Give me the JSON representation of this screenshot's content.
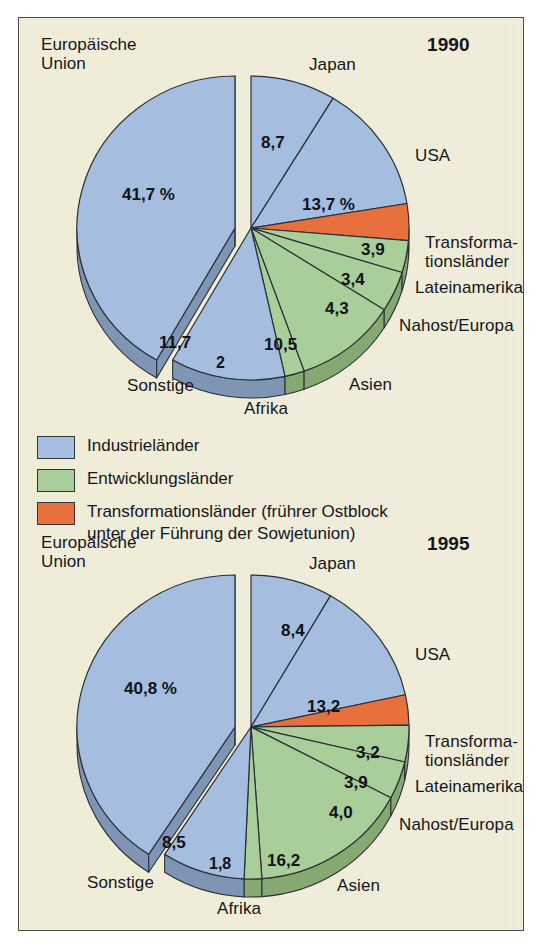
{
  "figure": {
    "background_color": "#eeecd7",
    "border_color": "#4a4a48"
  },
  "colors": {
    "industrial": "#a5bedf",
    "industrial_side": "#7f95b4",
    "developing": "#a9ce99",
    "developing_side": "#86a871",
    "transformation": "#e8703c",
    "transformation_side": "#bc5a2e",
    "outline": "#2b3038"
  },
  "legend": {
    "items": [
      {
        "label": "Industrieländer",
        "color": "#a5bedf",
        "name": "industrial"
      },
      {
        "label": "Entwicklungsländer",
        "color": "#a9ce99",
        "name": "developing"
      },
      {
        "label": "Transformationsländer (frührer Ostblock\nunter der Führung der Sowjetunion)",
        "color": "#e8703c",
        "name": "transformation"
      }
    ]
  },
  "chart_data": [
    {
      "type": "pie",
      "title": "1990",
      "unit": "%",
      "center": [
        240,
        223
      ],
      "radius": 162,
      "explode_slice": "Europäische Union",
      "categories": [
        "Japan",
        "USA",
        "Transformationsländer",
        "Lateinamerika",
        "Nahost/Europa",
        "Asien",
        "Afrika",
        "Sonstige",
        "Europäische Union"
      ],
      "values": [
        8.7,
        13.7,
        3.9,
        3.4,
        4.3,
        10.5,
        2,
        11.7,
        41.7
      ],
      "value_labels": [
        "8,7",
        "13,7 %",
        "3,9",
        "3,4",
        "4,3",
        "10,5",
        "2",
        "11,7",
        "41,7 %"
      ],
      "groups": [
        "Industrieländer",
        "Industrieländer",
        "Transformationsländer",
        "Entwicklungsländer",
        "Entwicklungsländer",
        "Entwicklungsländer",
        "Entwicklungsländer",
        "Industrieländer",
        "Industrieländer"
      ],
      "callout_labels": [
        "Japan",
        "USA",
        "Transforma-\ntionsländer",
        "Lateinamerika",
        "Nahost/Europa",
        "Asien",
        "Afrika",
        "Sonstige",
        "Europäische\nUnion"
      ]
    },
    {
      "type": "pie",
      "title": "1995",
      "unit": "%",
      "center": [
        240,
        268
      ],
      "radius": 162,
      "explode_slice": "Europäische Union",
      "categories": [
        "Japan",
        "USA",
        "Transformationsländer",
        "Lateinamerika",
        "Nahost/Europa",
        "Asien",
        "Afrika",
        "Sonstige",
        "Europäische Union"
      ],
      "values": [
        8.4,
        13.2,
        3.2,
        3.9,
        4.0,
        16.2,
        1.8,
        8.5,
        40.8
      ],
      "value_labels": [
        "8,4",
        "13,2",
        "3,2",
        "3,9",
        "4,0",
        "16,2",
        "1,8",
        "8,5",
        "40,8 %"
      ],
      "groups": [
        "Industrieländer",
        "Industrieländer",
        "Transformationsländer",
        "Entwicklungsländer",
        "Entwicklungsländer",
        "Entwicklungsländer",
        "Entwicklungsländer",
        "Industrieländer",
        "Industrieländer"
      ],
      "callout_labels": [
        "Japan",
        "USA",
        "Transforma-\ntionsländer",
        "Lateinamerika",
        "Nahost/Europa",
        "Asien",
        "Afrika",
        "Sonstige",
        "Europäische\nUnion"
      ]
    }
  ],
  "chart1": {
    "year": "1990",
    "labels": {
      "eu": "Europäische\nUnion",
      "japan": "Japan",
      "usa": "USA",
      "transformation": "Transforma-\ntionsländer",
      "lateinamerika": "Lateinamerika",
      "nahost": "Nahost/Europa",
      "asien": "Asien",
      "afrika": "Afrika",
      "sonstige": "Sonstige"
    },
    "values": {
      "eu": "41,7 %",
      "japan": "8,7",
      "usa": "13,7 %",
      "transformation": "3,9",
      "lateinamerika": "3,4",
      "nahost": "4,3",
      "asien": "10,5",
      "afrika": "2",
      "sonstige": "11,7"
    }
  },
  "chart2": {
    "year": "1995",
    "labels": {
      "eu": "Europäische\nUnion",
      "japan": "Japan",
      "usa": "USA",
      "transformation": "Transforma-\ntionsländer",
      "lateinamerika": "Lateinamerika",
      "nahost": "Nahost/Europa",
      "asien": "Asien",
      "afrika": "Afrika",
      "sonstige": "Sonstige"
    },
    "values": {
      "eu": "40,8 %",
      "japan": "8,4",
      "usa": "13,2",
      "transformation": "3,2",
      "lateinamerika": "3,9",
      "nahost": "4,0",
      "asien": "16,2",
      "afrika": "1,8",
      "sonstige": "8,5"
    }
  }
}
